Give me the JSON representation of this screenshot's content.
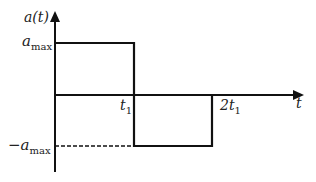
{
  "diagram": {
    "type": "square-wave acceleration profile",
    "y_axis_label": "a(t)",
    "x_axis_label": "t",
    "y_ticks": [
      {
        "label_main": "a",
        "label_sub": "max",
        "value": "a_max"
      },
      {
        "label_main": "−a",
        "label_sub": "max",
        "value": "-a_max"
      }
    ],
    "x_ticks": [
      {
        "label_main": "t",
        "label_sub": "1",
        "value": "t1"
      },
      {
        "label_main": "2t",
        "label_sub": "1",
        "value": "2t1"
      }
    ],
    "segments": [
      {
        "from": "0",
        "to": "t1",
        "level": "a_max"
      },
      {
        "from": "t1",
        "to": "2t1",
        "level": "-a_max"
      }
    ],
    "colors": {
      "line": "#111111",
      "text": "#222222",
      "background": "#ffffff"
    }
  }
}
